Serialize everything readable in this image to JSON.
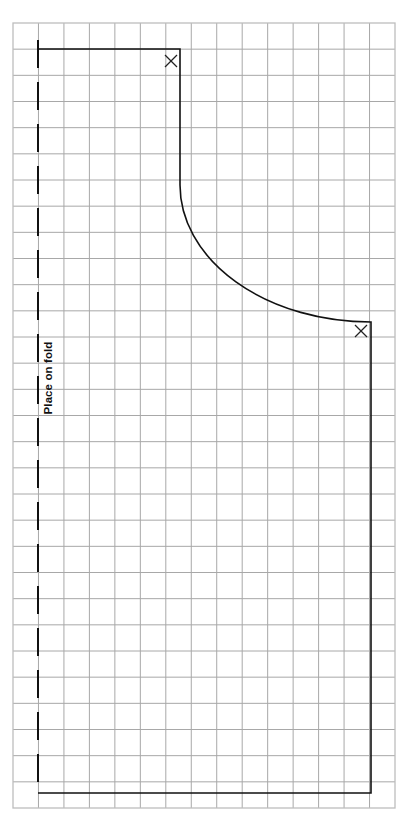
{
  "pattern": {
    "fold_label": "Place on fold",
    "grid": {
      "columns": 15,
      "rows": 30,
      "left": 13,
      "top": 23,
      "right": 395,
      "bottom": 808,
      "line_color": "#a8a8a8"
    },
    "outline_color": "#111111",
    "notch_marks": [
      {
        "name": "neck-notch",
        "symbol": "X",
        "x": 171,
        "y": 61
      },
      {
        "name": "armhole-notch",
        "symbol": "X",
        "x": 361,
        "y": 331
      }
    ]
  }
}
